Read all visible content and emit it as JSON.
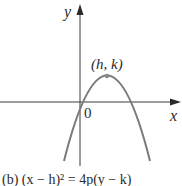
{
  "figure": {
    "axes": {
      "x_label": "x",
      "y_label": "y",
      "origin_label": "0"
    },
    "vertex_label": "(h, k)",
    "caption": "(b)  (x − h)² = 4p(y − k)",
    "colors": {
      "axis": "#3a3a3a",
      "curve": "#7a7a7a",
      "vertex_point": "#8a8a8a",
      "text": "#2a2a2a"
    }
  }
}
